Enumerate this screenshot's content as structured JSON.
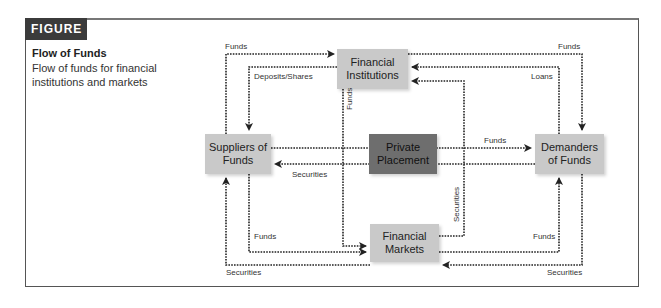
{
  "figure": {
    "tag": "FIGURE 2.1",
    "title": "Flow of Funds",
    "subtitle": "Flow of funds for financial institutions and markets"
  },
  "nodes": {
    "financial_institutions": "Financial Institutions",
    "suppliers": "Suppliers of Funds",
    "private_placement": "Private Placement",
    "demanders": "Demanders of Funds",
    "financial_markets": "Financial Markets"
  },
  "edges": [
    {
      "from": "Suppliers of Funds",
      "to": "Financial Institutions",
      "label": "Funds"
    },
    {
      "from": "Financial Institutions",
      "to": "Suppliers of Funds",
      "label": "Deposits/Shares"
    },
    {
      "from": "Financial Institutions",
      "to": "Financial Markets",
      "label": "Funds"
    },
    {
      "from": "Financial Institutions",
      "to": "Demanders of Funds",
      "label": "Funds"
    },
    {
      "from": "Demanders of Funds",
      "to": "Financial Institutions",
      "label": "Loans"
    },
    {
      "from": "Financial Markets",
      "to": "Financial Institutions",
      "label": "Securities"
    },
    {
      "from": "Suppliers of Funds",
      "to": "Demanders of Funds",
      "label": "Funds"
    },
    {
      "from": "Demanders of Funds",
      "to": "Suppliers of Funds",
      "label": "Securities"
    },
    {
      "from": "Suppliers of Funds",
      "to": "Financial Markets",
      "label": "Funds"
    },
    {
      "from": "Financial Markets",
      "to": "Suppliers of Funds",
      "label": "Securities"
    },
    {
      "from": "Financial Markets",
      "to": "Demanders of Funds",
      "label": "Funds"
    },
    {
      "from": "Demanders of Funds",
      "to": "Financial Markets",
      "label": "Securities"
    }
  ],
  "labels": {
    "top_left_funds": "Funds",
    "deposits_shares": "Deposits/Shares",
    "top_right_funds": "Funds",
    "loans": "Loans",
    "vertical_funds": "Funds",
    "vertical_securities": "Securities",
    "middle_securities": "Securities",
    "middle_funds": "Funds",
    "bottom_left_funds": "Funds",
    "bottom_left_securities": "Securities",
    "bottom_right_funds": "Funds",
    "bottom_right_securities": "Securities"
  },
  "colors": {
    "header_bg": "#3b3b3b",
    "light_node": "#c9c9c9",
    "dark_node": "#6e6e6e",
    "line": "#222222"
  }
}
